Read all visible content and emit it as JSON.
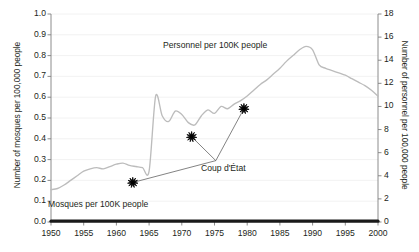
{
  "chart_data": {
    "type": "line",
    "title": "",
    "xlabel": "",
    "xlim": [
      1950,
      2000
    ],
    "xticks": [
      1950,
      1955,
      1960,
      1965,
      1970,
      1975,
      1980,
      1985,
      1990,
      1995,
      2000
    ],
    "grid": true,
    "legend_position": "inline-annotations",
    "axes": {
      "left": {
        "label": "Number of mosques per 100,000 people",
        "ylim": [
          0.0,
          1.0
        ],
        "yticks": [
          "0.0",
          "0.1",
          "0.2",
          "0.3",
          "0.4",
          "0.5",
          "0.6",
          "0.7",
          "0.8",
          "0.9",
          "1.0"
        ]
      },
      "right": {
        "label": "Number of personnel per 100,000 people",
        "ylim": [
          0,
          18
        ],
        "yticks": [
          "0",
          "2",
          "4",
          "6",
          "8",
          "10",
          "12",
          "14",
          "16",
          "18"
        ]
      }
    },
    "series": [
      {
        "name": "Personnel per 100K people",
        "axis": "right",
        "color": "#bcbcbc",
        "x": [
          1950,
          1951,
          1952,
          1953,
          1954,
          1955,
          1956,
          1957,
          1958,
          1959,
          1960,
          1961,
          1962,
          1963,
          1964,
          1965,
          1966,
          1967,
          1968,
          1969,
          1970,
          1971,
          1972,
          1973,
          1974,
          1975,
          1976,
          1977,
          1978,
          1979,
          1980,
          1981,
          1982,
          1983,
          1984,
          1985,
          1986,
          1987,
          1988,
          1989,
          1990,
          1991,
          1992,
          1993,
          1994,
          1995,
          1996,
          1997,
          1998,
          1999,
          2000
        ],
        "values": [
          2.8,
          2.9,
          3.2,
          3.6,
          4.0,
          4.4,
          4.6,
          4.7,
          4.6,
          4.8,
          5.0,
          5.1,
          4.9,
          4.8,
          4.7,
          4.4,
          10.9,
          9.2,
          8.7,
          9.6,
          9.3,
          8.6,
          8.4,
          9.2,
          9.7,
          9.4,
          10.0,
          9.8,
          10.2,
          10.5,
          10.9,
          11.4,
          11.9,
          12.3,
          12.8,
          13.3,
          13.9,
          14.4,
          14.9,
          15.2,
          14.9,
          13.6,
          13.3,
          13.1,
          12.9,
          12.7,
          12.4,
          12.1,
          11.8,
          11.4,
          10.9
        ]
      },
      {
        "name": "Mosques per 100K people",
        "axis": "left",
        "color": "#1a1a1a",
        "x": [
          1950,
          1955,
          1960,
          1965,
          1970,
          1975,
          1980,
          1985,
          1990,
          1995,
          2000
        ],
        "values": [
          0.004,
          0.004,
          0.004,
          0.004,
          0.004,
          0.004,
          0.004,
          0.004,
          0.004,
          0.004,
          0.004
        ]
      }
    ],
    "markers": [
      {
        "label": "Coup d'État",
        "x": 1962.5,
        "y_left": 0.19
      },
      {
        "label": "Coup d'État",
        "x": 1971.5,
        "y_left": 0.41
      },
      {
        "label": "Coup d'État",
        "x": 1979.5,
        "y_left": 0.545
      }
    ],
    "annotations": [
      {
        "name": "personnel-label",
        "text": "Personnel per 100K people"
      },
      {
        "name": "mosques-label",
        "text": "Mosques per 100K people"
      },
      {
        "name": "coup-label",
        "text": "Coup d'État"
      }
    ]
  },
  "colors": {
    "personnel_line": "#bcbcbc",
    "mosques_line": "#1a1a1a",
    "axis": "#808080",
    "grid": "#f0f0f0",
    "text": "#231f20",
    "marker": "#000000",
    "leader": "#5a5a5a"
  }
}
